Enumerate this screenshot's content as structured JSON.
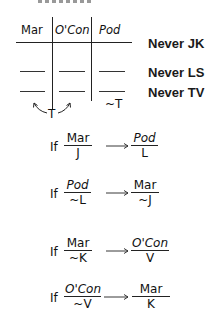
{
  "top_cropped_text": "",
  "grid": {
    "columns": [
      "Mar",
      "O'Con",
      "Pod"
    ],
    "rows": [
      {
        "cells": [
          "",
          "",
          ""
        ],
        "constraint": "Never JK"
      },
      {
        "cells": [
          "",
          "",
          ""
        ],
        "constraint": "Never LS"
      },
      {
        "cells": [
          "",
          "",
          ""
        ],
        "constraint": "Never TV"
      }
    ],
    "below_pod": "~T",
    "t_label": "T",
    "t_note": "T can go in Mar or O'Con"
  },
  "constraints": [
    "Never JK",
    "Never LS",
    "Never TV"
  ],
  "rules": [
    {
      "if_label": "If",
      "from": {
        "top": "Mar",
        "bottom": "J"
      },
      "to": {
        "top": "Pod",
        "bottom": "L"
      }
    },
    {
      "if_label": "If",
      "from": {
        "top": "Pod",
        "bottom": "~L"
      },
      "to": {
        "top": "Mar",
        "bottom": "~J"
      }
    },
    {
      "if_label": "If",
      "from": {
        "top": "Mar",
        "bottom": "~K"
      },
      "to": {
        "top": "O'Con",
        "bottom": "V"
      }
    },
    {
      "if_label": "If",
      "from": {
        "top": "O'Con",
        "bottom": "~V"
      },
      "to": {
        "top": "Mar",
        "bottom": "K"
      }
    }
  ],
  "colors": {
    "ink": "#111111",
    "background": "#ffffff"
  }
}
